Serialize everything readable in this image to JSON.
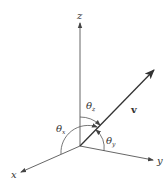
{
  "diagram": {
    "axes": {
      "x": {
        "label": "x"
      },
      "y": {
        "label": "y"
      },
      "z": {
        "label": "z"
      }
    },
    "vector": {
      "label": "v"
    },
    "angles": [
      {
        "symbol": "θ",
        "sub": "x"
      },
      {
        "symbol": "θ",
        "sub": "y"
      },
      {
        "symbol": "θ",
        "sub": "z"
      }
    ],
    "colors": {
      "line": "#444444",
      "background": "#ffffff"
    }
  }
}
